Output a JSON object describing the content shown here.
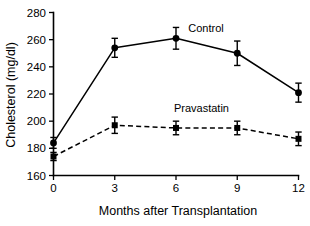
{
  "chart_data": {
    "type": "line",
    "title": "",
    "xlabel": "Months after Transplantation",
    "ylabel": "Cholesterol (mg/dl)",
    "x": [
      0,
      3,
      6,
      9,
      12
    ],
    "xticklabels": [
      "0",
      "3",
      "6",
      "9",
      "12"
    ],
    "yticklabels": [
      "160",
      "180",
      "200",
      "220",
      "240",
      "260",
      "280"
    ],
    "yticks": [
      160,
      180,
      200,
      220,
      240,
      260,
      280
    ],
    "xlim": [
      0,
      12
    ],
    "ylim": [
      160,
      280
    ],
    "grid": false,
    "legend_position": "inline-annotations",
    "series": [
      {
        "name": "Control",
        "marker": "circle",
        "linestyle": "solid",
        "label_x": 6.6,
        "label_y": 266,
        "values": [
          184,
          254,
          261,
          250,
          221
        ],
        "errors": [
          4,
          7,
          8,
          9,
          7
        ]
      },
      {
        "name": "Pravastatin",
        "marker": "square",
        "linestyle": "dashed",
        "label_x": 5.9,
        "label_y": 207,
        "values": [
          174,
          197,
          195,
          195,
          187
        ],
        "errors": [
          3,
          6,
          5,
          5,
          5
        ]
      }
    ]
  }
}
